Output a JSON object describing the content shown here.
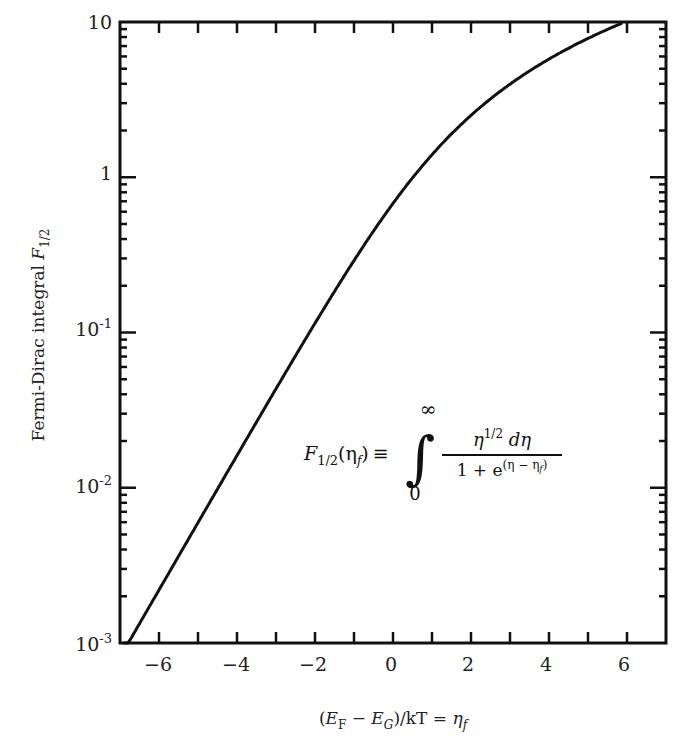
{
  "chart_data": {
    "type": "line",
    "title": "",
    "xlabel": "(E_F − E_G)/kT = η_f",
    "ylabel": "Fermi-Dirac integral F_1/2",
    "xlim": [
      -7,
      7
    ],
    "ylim": [
      0.001,
      10
    ],
    "yscale": "log",
    "grid": false,
    "legend": null,
    "x_ticks": [
      -6,
      -4,
      -2,
      0,
      2,
      4,
      6
    ],
    "x_tick_labels": [
      "−6",
      "−4",
      "−2",
      "0",
      "2",
      "4",
      "6"
    ],
    "y_ticks": [
      0.001,
      0.01,
      0.1,
      1,
      10
    ],
    "y_tick_labels": [
      "10^-3",
      "10^-2",
      "10^-1",
      "1",
      "10"
    ],
    "series": [
      {
        "name": "F_1/2(η_f)",
        "x": [
          -6.9,
          -6,
          -5,
          -4,
          -3,
          -2,
          -1,
          0,
          1,
          2,
          3,
          4,
          5,
          5.85
        ],
        "values": [
          0.00089,
          0.00219,
          0.00596,
          0.0161,
          0.0435,
          0.1146,
          0.2905,
          0.6781,
          1.3964,
          2.5025,
          3.977,
          5.7708,
          7.8527,
          9.8
        ]
      }
    ],
    "annotations": [
      {
        "text": "F_1/2(η_f) ≡ ∫_0^∞ η^1/2 dη / (1 + e^(η − η_f))",
        "position": "center-right"
      }
    ]
  },
  "axes": {
    "y_title_main": "Fermi-Dirac integral ",
    "y_title_sym": "F",
    "y_title_sub": "1/2",
    "x_title": {
      "open": "(",
      "E1": "E",
      "sub_F": "F",
      "minus": " − ",
      "E2": "E",
      "sub_G": "G",
      "rest": ")/kT = ",
      "eta": "η",
      "sub_f": "f"
    },
    "x_labels": [
      "−6",
      "−4",
      "−2",
      "0",
      "2",
      "4",
      "6"
    ],
    "y_labels": [
      {
        "base": "10",
        "exp": ""
      },
      {
        "base": "1",
        "exp": ""
      },
      {
        "base": "10",
        "exp": "-1"
      },
      {
        "base": "10",
        "exp": "-2"
      },
      {
        "base": "10",
        "exp": "-3"
      }
    ]
  },
  "formula": {
    "lhs_F": "F",
    "lhs_sub": "1/2",
    "lhs_arg": "(η",
    "lhs_arg_sub": "f",
    "lhs_close": ")",
    "equiv": "≡",
    "integral": "∫",
    "upper": "∞",
    "lower": "0",
    "num": "η",
    "num_exp": "1/2",
    "num_rest": " dη",
    "den": "1 + e",
    "den_exp": "(η − η",
    "den_exp_sub": "f",
    "den_exp_close": ")"
  }
}
